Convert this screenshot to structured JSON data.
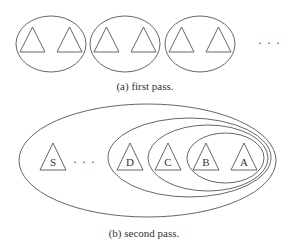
{
  "figure_a": {
    "caption": "(a) first pass.",
    "groups": [
      {
        "cx": 51,
        "cy": 44,
        "rx": 35,
        "ry": 28,
        "triangles": [
          {
            "x": 20,
            "y": 27
          },
          {
            "x": 57,
            "y": 27
          }
        ]
      },
      {
        "cx": 125,
        "cy": 44,
        "rx": 35,
        "ry": 28,
        "triangles": [
          {
            "x": 94,
            "y": 27
          },
          {
            "x": 131,
            "y": 27
          }
        ]
      },
      {
        "cx": 200,
        "cy": 44,
        "rx": 35,
        "ry": 28,
        "triangles": [
          {
            "x": 169,
            "y": 27
          },
          {
            "x": 206,
            "y": 27
          }
        ]
      }
    ],
    "ellipsis": "· · ·"
  },
  "figure_b": {
    "caption": "(b) second pass.",
    "ellipsis": "· · ·",
    "ellipses": [
      {
        "name": "S",
        "cx": 147.5,
        "cy": 160.5,
        "rx": 128.5,
        "ry": 56.5
      },
      {
        "name": "D",
        "cx": 189.5,
        "cy": 157.5,
        "rx": 81.5,
        "ry": 39.5
      },
      {
        "name": "C",
        "cx": 208,
        "cy": 158,
        "rx": 60,
        "ry": 33
      },
      {
        "name": "B",
        "cx": 225.5,
        "cy": 158,
        "rx": 38.5,
        "ry": 25
      }
    ],
    "nodes": [
      {
        "label": "S",
        "x": 40
      },
      {
        "label": "D",
        "x": 117
      },
      {
        "label": "C",
        "x": 155
      },
      {
        "label": "B",
        "x": 193
      },
      {
        "label": "A",
        "x": 231
      }
    ]
  },
  "style": {
    "stroke_color": "#555555",
    "background": "#ffffff"
  }
}
